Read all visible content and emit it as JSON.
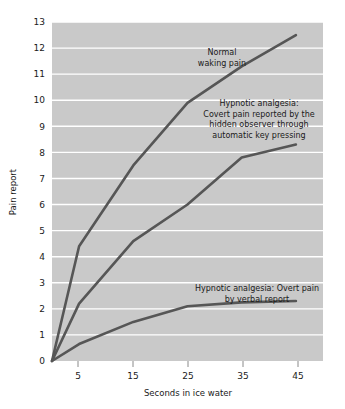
{
  "chart_data": {
    "type": "line",
    "title": "",
    "xlabel": "Seconds in ice water",
    "ylabel": "Pain report",
    "xlim": [
      0,
      50
    ],
    "ylim": [
      0,
      13
    ],
    "grid": true,
    "legend_position": "inline-annotations",
    "xticks": [
      "5",
      "15",
      "25",
      "35",
      "45"
    ],
    "xtick_values": [
      5,
      15,
      25,
      35,
      45
    ],
    "yticks": [
      "0",
      "1",
      "2",
      "3",
      "4",
      "5",
      "6",
      "7",
      "8",
      "9",
      "10",
      "11",
      "12",
      "13"
    ],
    "ytick_values": [
      0,
      1,
      2,
      3,
      4,
      5,
      6,
      7,
      8,
      9,
      10,
      11,
      12,
      13
    ],
    "x": [
      0,
      5,
      15,
      25,
      35,
      45
    ],
    "series": [
      {
        "name": "Normal waking pain",
        "values": [
          0,
          4.4,
          7.5,
          9.9,
          11.3,
          12.5
        ],
        "color": "#565656"
      },
      {
        "name": "Hypnotic analgesia: Covert pain reported by the hidden observer through automatic key pressing",
        "values": [
          0,
          2.2,
          4.6,
          6.0,
          7.8,
          8.3
        ],
        "color": "#565656"
      },
      {
        "name": "Hypnotic analgesia: Overt pain by verbal report",
        "values": [
          0,
          0.65,
          1.5,
          2.1,
          2.25,
          2.3
        ],
        "color": "#565656"
      }
    ],
    "annotations": [
      {
        "id": "normal-waking-pain",
        "lines": [
          "Normal",
          "waking pain"
        ]
      },
      {
        "id": "covert-pain",
        "lines": [
          "Hypnotic analgesia:",
          "Covert pain reported by the",
          "hidden observer through",
          "automatic key pressing"
        ]
      },
      {
        "id": "overt-pain",
        "lines": [
          "Hypnotic analgesia: Overt pain",
          "by verbal report"
        ]
      }
    ],
    "colors": {
      "plot_background": "#c9c9c9",
      "page_background": "#ffffff",
      "gridline": "#ffffff",
      "line": "#565656",
      "text": "#1a1a1a"
    }
  }
}
